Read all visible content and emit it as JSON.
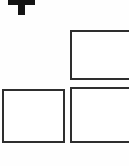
{
  "canvas": {
    "width": 129,
    "height": 166,
    "background_color": "#fefefe"
  },
  "glyph": {
    "name": "letter-t",
    "character": "T",
    "color": "#131313",
    "clipped": "top"
  },
  "boxes": [
    {
      "id": "box-top-right",
      "label": "",
      "border_color": "#2e2e2e",
      "fill_color": "#ffffff",
      "clipped": "right"
    },
    {
      "id": "box-bottom-left",
      "label": "",
      "border_color": "#2e2e2e",
      "fill_color": "#ffffff",
      "clipped": "none"
    },
    {
      "id": "box-bottom-right",
      "label": "",
      "border_color": "#2e2e2e",
      "fill_color": "#ffffff",
      "clipped": "right"
    }
  ]
}
